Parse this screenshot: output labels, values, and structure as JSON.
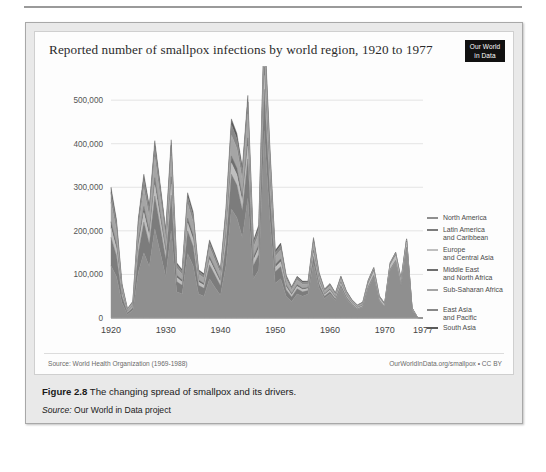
{
  "figure": {
    "caption_label": "Figure 2.8",
    "caption_text": "The changing spread of smallpox and its drivers.",
    "source_label": "Source:",
    "source_text": "Our World in Data project"
  },
  "chart": {
    "title": "Reported number of smallpox infections by world region, 1920 to 1977",
    "logo_line1": "Our World",
    "logo_line2": "in Data",
    "source_note": "Source: World Health Organization (1969-1988)",
    "attribution": "OurWorldInData.org/smallpox • CC BY"
  },
  "chart_data": {
    "type": "area",
    "title": "Reported number of smallpox infections by world region, 1920 to 1977",
    "xlabel": "",
    "ylabel": "",
    "stacked": true,
    "grid": true,
    "legend_position": "right",
    "xlim": [
      1920,
      1977
    ],
    "ylim": [
      0,
      560000
    ],
    "xticks": [
      1920,
      1930,
      1940,
      1950,
      1960,
      1970,
      1977
    ],
    "yticks": [
      0,
      100000,
      200000,
      300000,
      400000,
      500000
    ],
    "ytick_labels": [
      "0",
      "100,000",
      "200,000",
      "300,000",
      "400,000",
      "500,000"
    ],
    "x": [
      1920,
      1921,
      1922,
      1923,
      1924,
      1925,
      1926,
      1927,
      1928,
      1929,
      1930,
      1931,
      1932,
      1933,
      1934,
      1935,
      1936,
      1937,
      1938,
      1939,
      1940,
      1941,
      1942,
      1943,
      1944,
      1945,
      1946,
      1947,
      1948,
      1949,
      1950,
      1951,
      1952,
      1953,
      1954,
      1955,
      1956,
      1957,
      1958,
      1959,
      1960,
      1961,
      1962,
      1963,
      1964,
      1965,
      1966,
      1967,
      1968,
      1969,
      1970,
      1971,
      1972,
      1973,
      1974,
      1975,
      1976,
      1977
    ],
    "series": [
      {
        "name": "South Asia",
        "color": "#8f8f8f",
        "values": [
          120000,
          95000,
          35000,
          8000,
          18000,
          105000,
          150000,
          118000,
          205000,
          150000,
          95000,
          200000,
          60000,
          55000,
          148000,
          120000,
          55000,
          50000,
          90000,
          70000,
          52000,
          120000,
          250000,
          230000,
          185000,
          275000,
          90000,
          110000,
          430000,
          230000,
          80000,
          90000,
          50000,
          38000,
          55000,
          50000,
          55000,
          125000,
          70000,
          45000,
          55000,
          40000,
          70000,
          45000,
          30000,
          20000,
          25000,
          70000,
          95000,
          40000,
          25000,
          110000,
          130000,
          75000,
          160000,
          18000,
          500,
          0
        ]
      },
      {
        "name": "East Asia and Pacific",
        "color": "#7c7c7c",
        "values": [
          65000,
          48000,
          15000,
          4000,
          6000,
          45000,
          70000,
          52000,
          75000,
          58000,
          40000,
          82000,
          24000,
          20000,
          52000,
          45000,
          20000,
          18000,
          32000,
          28000,
          22000,
          48000,
          80000,
          75000,
          62000,
          90000,
          30000,
          36000,
          95000,
          62000,
          26000,
          28000,
          15000,
          10000,
          12000,
          10000,
          8000,
          16000,
          9000,
          5000,
          5000,
          3500,
          5000,
          3000,
          2000,
          1400,
          1500,
          2500,
          3000,
          1200,
          800,
          2000,
          2500,
          1400,
          2500,
          600,
          100,
          0
        ]
      },
      {
        "name": "Sub-Saharan Africa",
        "color": "#bfbfbf",
        "values": [
          22000,
          16000,
          6000,
          2000,
          3000,
          16000,
          22000,
          18000,
          26000,
          20000,
          14000,
          26000,
          9000,
          7500,
          18000,
          16000,
          7500,
          7000,
          12000,
          10000,
          8000,
          17000,
          26000,
          24000,
          20000,
          30000,
          12000,
          14000,
          32000,
          22000,
          10000,
          11000,
          7000,
          5000,
          6000,
          5200,
          4500,
          9000,
          5500,
          3500,
          4000,
          3000,
          4500,
          3000,
          2200,
          1800,
          2200,
          6000,
          9000,
          5500,
          4500,
          9000,
          11000,
          8000,
          12000,
          3000,
          400,
          0
        ]
      },
      {
        "name": "Middle East and North Africa",
        "color": "#6e6e6e",
        "values": [
          14000,
          10000,
          3500,
          1200,
          1800,
          10000,
          14000,
          11000,
          16000,
          12500,
          8500,
          16000,
          5500,
          4500,
          11000,
          10000,
          4500,
          4200,
          7200,
          6200,
          5000,
          10500,
          16000,
          15000,
          12500,
          18500,
          7200,
          8500,
          19000,
          13500,
          6200,
          6800,
          4200,
          3000,
          3600,
          3100,
          2700,
          5500,
          3300,
          2100,
          2400,
          1800,
          2700,
          1800,
          1300,
          1100,
          1300,
          2200,
          2600,
          1300,
          1000,
          1800,
          2200,
          1500,
          2200,
          600,
          80,
          0
        ]
      },
      {
        "name": "Europe and Central Asia",
        "color": "#a5a5a5",
        "values": [
          45000,
          32000,
          11000,
          3500,
          5500,
          30000,
          42000,
          33000,
          48000,
          37000,
          26000,
          48000,
          16000,
          13500,
          33000,
          30000,
          13500,
          12500,
          21500,
          18500,
          15000,
          31500,
          48000,
          45000,
          37500,
          55000,
          21500,
          25500,
          57000,
          40500,
          18500,
          20500,
          12500,
          9000,
          10800,
          9300,
          8100,
          16500,
          9900,
          6300,
          7200,
          5400,
          8100,
          5400,
          3900,
          3300,
          3900,
          3300,
          2600,
          1300,
          900,
          1500,
          1800,
          1200,
          1800,
          500,
          60,
          0
        ]
      },
      {
        "name": "Latin America and Caribbean",
        "color": "#888888",
        "values": [
          22000,
          16000,
          5500,
          1800,
          2800,
          15000,
          21000,
          16500,
          24000,
          18500,
          13000,
          24000,
          8000,
          6800,
          16500,
          15000,
          6800,
          6200,
          10800,
          9200,
          7500,
          15800,
          24000,
          22500,
          18800,
          27500,
          10800,
          12800,
          28500,
          20200,
          9200,
          10200,
          6200,
          4500,
          5400,
          4600,
          4000,
          8200,
          4900,
          3100,
          3600,
          2700,
          4000,
          2700,
          1900,
          1600,
          1900,
          2600,
          3100,
          1600,
          1200,
          2400,
          2900,
          1900,
          2900,
          700,
          80,
          0
        ]
      },
      {
        "name": "North America",
        "color": "#5a5a5a",
        "values": [
          12000,
          9000,
          3000,
          1000,
          1500,
          8000,
          11000,
          9000,
          13000,
          10000,
          7000,
          13000,
          4500,
          3700,
          9000,
          8000,
          3700,
          3400,
          5800,
          5000,
          4000,
          8500,
          13000,
          12000,
          10000,
          15000,
          5800,
          7000,
          15500,
          11000,
          5000,
          5500,
          3400,
          2400,
          2900,
          2500,
          2200,
          4500,
          2600,
          1700,
          1900,
          1500,
          2200,
          1500,
          1000,
          850,
          1000,
          700,
          600,
          300,
          200,
          300,
          350,
          250,
          350,
          100,
          20,
          0
        ]
      }
    ],
    "legend_entries": [
      "North America",
      "Latin America and Caribbean",
      "Europe and Central Asia",
      "Middle East and North Africa",
      "Sub-Saharan Africa",
      "East Asia and Pacific",
      "South Asia"
    ]
  }
}
